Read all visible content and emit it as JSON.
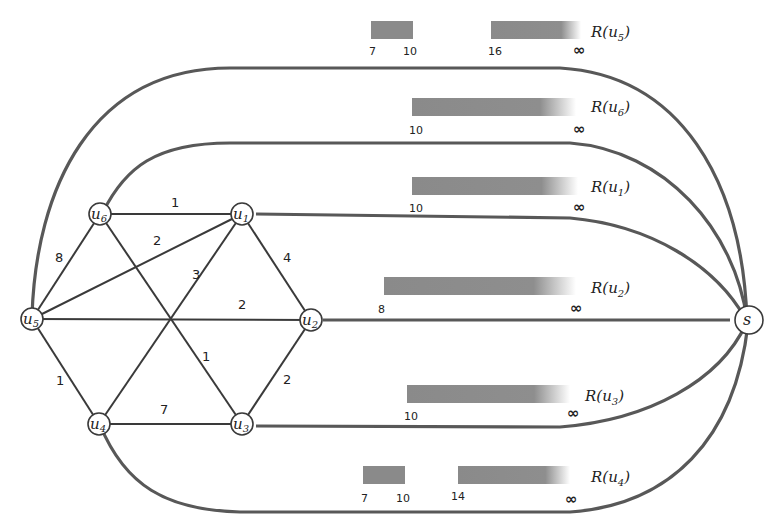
{
  "diagram": {
    "type": "graph-with-interval-ranges",
    "source_node": {
      "id": "s",
      "label": "s"
    },
    "nodes": [
      {
        "id": "u1",
        "base": "u",
        "sub": "1"
      },
      {
        "id": "u2",
        "base": "u",
        "sub": "2"
      },
      {
        "id": "u3",
        "base": "u",
        "sub": "3"
      },
      {
        "id": "u4",
        "base": "u",
        "sub": "4"
      },
      {
        "id": "u5",
        "base": "u",
        "sub": "5"
      },
      {
        "id": "u6",
        "base": "u",
        "sub": "6"
      }
    ],
    "edges": [
      {
        "from": "u6",
        "to": "u1",
        "weight": "1"
      },
      {
        "from": "u5",
        "to": "u1",
        "weight": "2"
      },
      {
        "from": "u4",
        "to": "u1",
        "weight": "3"
      },
      {
        "from": "u1",
        "to": "u2",
        "weight": "4"
      },
      {
        "from": "u5",
        "to": "u6",
        "weight": "8"
      },
      {
        "from": "u5",
        "to": "u2",
        "weight": "2"
      },
      {
        "from": "u6",
        "to": "u3",
        "weight": "1"
      },
      {
        "from": "u5",
        "to": "u4",
        "weight": "1"
      },
      {
        "from": "u2",
        "to": "u3",
        "weight": "2"
      },
      {
        "from": "u4",
        "to": "u3",
        "weight": "7"
      }
    ],
    "ranges": [
      {
        "node": "u5",
        "label_base": "R(u",
        "label_sub": "5",
        "label_close": ")",
        "ticks": [
          "7",
          "10",
          "16"
        ],
        "infinity": "∞"
      },
      {
        "node": "u6",
        "label_base": "R(u",
        "label_sub": "6",
        "label_close": ")",
        "ticks": [
          "10"
        ],
        "infinity": "∞"
      },
      {
        "node": "u1",
        "label_base": "R(u",
        "label_sub": "1",
        "label_close": ")",
        "ticks": [
          "10"
        ],
        "infinity": "∞"
      },
      {
        "node": "u2",
        "label_base": "R(u",
        "label_sub": "2",
        "label_close": ")",
        "ticks": [
          "8"
        ],
        "infinity": "∞"
      },
      {
        "node": "u3",
        "label_base": "R(u",
        "label_sub": "3",
        "label_close": ")",
        "ticks": [
          "10"
        ],
        "infinity": "∞"
      },
      {
        "node": "u4",
        "label_base": "R(u",
        "label_sub": "4",
        "label_close": ")",
        "ticks": [
          "7",
          "10",
          "14"
        ],
        "infinity": "∞"
      }
    ],
    "colors": {
      "bar": "#8a8a8a",
      "route": "#585858",
      "edge": "#3a3a3a",
      "background": "#ffffff"
    }
  }
}
